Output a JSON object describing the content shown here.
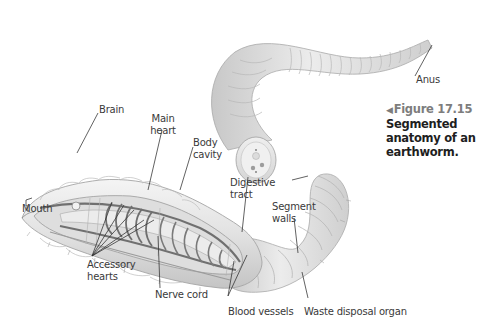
{
  "figure": {
    "marker": "◀",
    "number": "Figure 17.15",
    "caption_line1": "Segmented",
    "caption_line2": "anatomy of an",
    "caption_line3": "earthworm."
  },
  "labels": {
    "brain": "Brain",
    "main_heart_1": "Main",
    "main_heart_2": "heart",
    "body_cavity_1": "Body",
    "body_cavity_2": "cavity",
    "digestive_tract_1": "Digestive",
    "digestive_tract_2": "tract",
    "segment_walls_1": "Segment",
    "segment_walls_2": "walls",
    "anus": "Anus",
    "mouth": "Mouth",
    "accessory_hearts_1": "Accessory",
    "accessory_hearts_2": "hearts",
    "nerve_cord": "Nerve cord",
    "blood_vessels": "Blood vessels",
    "waste_disposal_organ": "Waste disposal organ"
  },
  "colors": {
    "background": "#ffffff",
    "body": "#e6e6e6",
    "body_shade": "#c8c8c8",
    "vessels": "#6e6e6e",
    "label_text": "#3a3a3a",
    "figure_number": "#7d7d7d"
  }
}
